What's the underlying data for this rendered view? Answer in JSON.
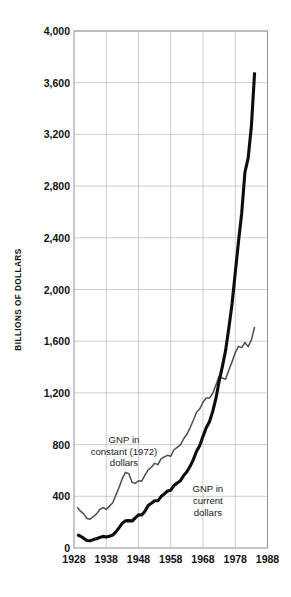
{
  "chart_data": {
    "type": "line",
    "title": "",
    "xlabel": "",
    "ylabel": "BILLIONS OF DOLLARS",
    "xlim": [
      1928,
      1988
    ],
    "ylim": [
      0,
      4000
    ],
    "grid": true,
    "legend": "inline-annotations",
    "x_ticks": [
      "1928",
      "1938",
      "1948",
      "1958",
      "1968",
      "1978",
      "1988"
    ],
    "y_ticks": [
      "0",
      "400",
      "800",
      "1,200",
      "1,600",
      "2,000",
      "2,400",
      "2,800",
      "3,200",
      "3,600",
      "4,000"
    ],
    "x_tick_values": [
      1928,
      1938,
      1948,
      1958,
      1968,
      1978,
      1988
    ],
    "y_tick_values": [
      0,
      400,
      800,
      1200,
      1600,
      2000,
      2400,
      2800,
      3200,
      3600,
      4000
    ],
    "annotations": [
      {
        "name": "constant-dollars-label",
        "text_lines": [
          "GNP in",
          "constant (1972)",
          "dollars"
        ],
        "x": 1943.5,
        "y": 880
      },
      {
        "name": "current-dollars-label",
        "text_lines": [
          "GNP in",
          "current",
          "dollars"
        ],
        "x": 1969.5,
        "y": 500
      }
    ],
    "series": [
      {
        "name": "GNP in current dollars",
        "color": "#0d0d0d",
        "width": 3.1,
        "x": [
          1929,
          1930,
          1931,
          1932,
          1933,
          1934,
          1935,
          1936,
          1937,
          1938,
          1939,
          1940,
          1941,
          1942,
          1943,
          1944,
          1945,
          1946,
          1947,
          1948,
          1949,
          1950,
          1951,
          1952,
          1953,
          1954,
          1955,
          1956,
          1957,
          1958,
          1959,
          1960,
          1961,
          1962,
          1963,
          1964,
          1965,
          1966,
          1967,
          1968,
          1969,
          1970,
          1971,
          1972,
          1973,
          1974,
          1975,
          1976,
          1977,
          1978,
          1979,
          1980,
          1981,
          1982,
          1983,
          1984
        ],
        "values": [
          103,
          91,
          76,
          58,
          56,
          65,
          72,
          82,
          90,
          85,
          91,
          100,
          125,
          158,
          192,
          210,
          212,
          209,
          232,
          257,
          256,
          285,
          328,
          346,
          365,
          365,
          398,
          419,
          441,
          447,
          483,
          503,
          520,
          560,
          590,
          632,
          684,
          749,
          793,
          864,
          930,
          977,
          1055,
          1157,
          1290,
          1403,
          1527,
          1700,
          1888,
          2128,
          2369,
          2590,
          2907,
          3017,
          3263,
          3680
        ]
      },
      {
        "name": "GNP in constant (1972) dollars",
        "color": "#4d4d4d",
        "width": 1.5,
        "x": [
          1929,
          1930,
          1931,
          1932,
          1933,
          1934,
          1935,
          1936,
          1937,
          1938,
          1939,
          1940,
          1941,
          1942,
          1943,
          1944,
          1945,
          1946,
          1947,
          1948,
          1949,
          1950,
          1951,
          1952,
          1953,
          1954,
          1955,
          1956,
          1957,
          1958,
          1959,
          1960,
          1961,
          1962,
          1963,
          1964,
          1965,
          1966,
          1967,
          1968,
          1969,
          1970,
          1971,
          1972,
          1973,
          1974,
          1975,
          1976,
          1977,
          1978,
          1979,
          1980,
          1981,
          1982,
          1983,
          1984
        ],
        "values": [
          315,
          285,
          264,
          228,
          223,
          242,
          264,
          298,
          313,
          299,
          324,
          350,
          410,
          470,
          540,
          585,
          575,
          508,
          500,
          520,
          517,
          563,
          605,
          625,
          655,
          645,
          690,
          705,
          717,
          710,
          760,
          779,
          798,
          845,
          880,
          930,
          988,
          1050,
          1077,
          1128,
          1160,
          1160,
          1195,
          1260,
          1330,
          1315,
          1305,
          1375,
          1440,
          1512,
          1560,
          1550,
          1590,
          1558,
          1610,
          1710
        ]
      }
    ]
  }
}
